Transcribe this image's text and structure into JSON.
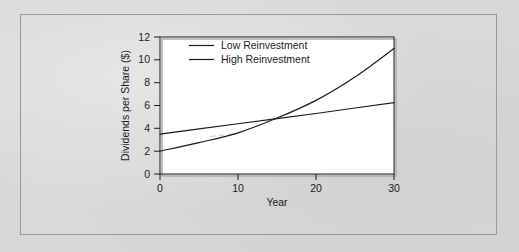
{
  "chart_data": {
    "type": "line",
    "title": "",
    "xlabel": "Year",
    "ylabel": "Dividends per Share ($)",
    "xlim": [
      0,
      30
    ],
    "ylim": [
      0,
      12
    ],
    "xticks": [
      0,
      10,
      20,
      30
    ],
    "yticks": [
      0,
      2,
      4,
      6,
      8,
      10,
      12
    ],
    "xtick_labels": [
      "0",
      "10",
      "20",
      "30"
    ],
    "ytick_labels": [
      "0",
      "2",
      "4",
      "6",
      "8",
      "10",
      "12"
    ],
    "grid": false,
    "legend_position": "top-center",
    "series": [
      {
        "name": "Low Reinvestment",
        "shape": "linear",
        "color": "#1b1b1b",
        "x": [
          0,
          5,
          10,
          15,
          20,
          25,
          30
        ],
        "values": [
          3.5,
          3.95,
          4.4,
          4.85,
          5.3,
          5.78,
          6.25
        ]
      },
      {
        "name": "High Reinvestment",
        "shape": "exponential",
        "color": "#1b1b1b",
        "x": [
          0,
          5,
          10,
          15,
          20,
          25,
          30
        ],
        "values": [
          2.0,
          2.75,
          3.6,
          4.9,
          6.45,
          8.5,
          11.0
        ]
      }
    ],
    "annotations": {
      "crossover_year": 14,
      "crossover_value": 4.7
    }
  },
  "legend": {
    "items": [
      {
        "label": "Low Reinvestment"
      },
      {
        "label": "High Reinvestment"
      }
    ]
  },
  "axes": {
    "x_title": "Year",
    "y_title": "Dividends per Share ($)"
  }
}
